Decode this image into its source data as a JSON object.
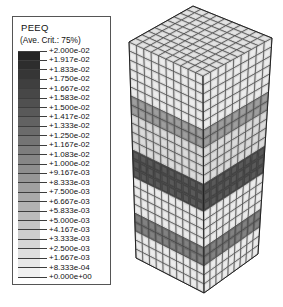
{
  "legend": {
    "title": "PEEQ",
    "subtitle": "(Ave. Crit.: 75%)",
    "labels": [
      "+2.000e-02",
      "+1.917e-02",
      "+1.833e-02",
      "+1.750e-02",
      "+1.667e-02",
      "+1.583e-02",
      "+1.500e-02",
      "+1.417e-02",
      "+1.333e-02",
      "+1.250e-02",
      "+1.167e-02",
      "+1.083e-02",
      "+1.000e-02",
      "+9.167e-03",
      "+8.333e-03",
      "+7.500e-03",
      "+6.667e-03",
      "+5.833e-03",
      "+5.000e-03",
      "+4.167e-03",
      "+3.333e-03",
      "+2.500e-03",
      "+1.667e-03",
      "+8.333e-04",
      "+0.000e+00"
    ]
  },
  "colors": {
    "background": "#ffffff",
    "legend_border": "#555555",
    "text": "#111111",
    "scale_max": "#242424",
    "scale_min": "#f0f0f0",
    "element_base": "#d8d8d8",
    "element_top": "#cfcfcf",
    "grid_line": "#3c3c3c",
    "outline": "#222222"
  },
  "model": {
    "description": "Isometric hexahedral-meshed cube specimen with plastic strain localization bands",
    "bands": [
      {
        "label": "upper-band",
        "from": 6,
        "to": 7,
        "color": "#8a8a8a"
      },
      {
        "label": "mid-shadow",
        "from": 8,
        "to": 11,
        "color": "#c7c7c7"
      },
      {
        "label": "primary-band",
        "from": 12,
        "to": 14,
        "color": "#454545"
      },
      {
        "label": "lower-band",
        "from": 19,
        "to": 20,
        "color": "#6d6d6d"
      }
    ],
    "mesh": {
      "top_cells": [
        10,
        10
      ],
      "left_cols": 10,
      "right_cols": 9,
      "rows": 24
    }
  },
  "chart_data": {
    "type": "heatmap",
    "title": "PEEQ",
    "subtitle": "(Ave. Crit.: 75%)",
    "variable": "PEEQ (equivalent plastic strain)",
    "averaging_criterion_pct": 75,
    "colormap": "grayscale, dark = maximum",
    "range": [
      0.0,
      0.02
    ],
    "levels": [
      0.02,
      0.01917,
      0.01833,
      0.0175,
      0.01667,
      0.01583,
      0.015,
      0.01417,
      0.01333,
      0.0125,
      0.01167,
      0.01083,
      0.01,
      0.009167,
      0.008333,
      0.0075,
      0.006667,
      0.005833,
      0.005,
      0.004167,
      0.003333,
      0.0025,
      0.001667,
      0.0008333,
      0.0
    ],
    "annotations": "Contour plot on a meshed cube; three dark bands of localized plastic strain cross the specimen"
  }
}
